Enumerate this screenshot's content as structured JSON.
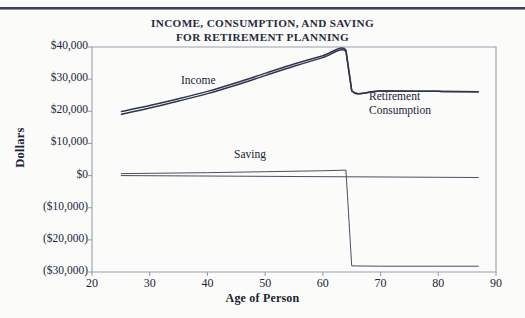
{
  "chart_data": {
    "type": "line",
    "title": "INCOME, CONSUMPTION, AND SAVING FOR RETIREMENT PLANNING",
    "title_line1": "INCOME, CONSUMPTION, AND SAVING",
    "title_line2": "FOR RETIREMENT PLANNING",
    "xlabel": "Age of Person",
    "ylabel": "Dollars",
    "xlim": [
      20,
      90
    ],
    "ylim": [
      -30000,
      40000
    ],
    "grid": false,
    "legend": "inline-annotations",
    "xticks": [
      20,
      30,
      40,
      50,
      60,
      70,
      80,
      90
    ],
    "xtick_labels": [
      "20",
      "30",
      "40",
      "50",
      "60",
      "70",
      "80",
      "90"
    ],
    "yticks": [
      40000,
      30000,
      20000,
      10000,
      0,
      -10000,
      -20000,
      -30000
    ],
    "ytick_labels": [
      "$40,000",
      "$30,000",
      "$20,000",
      "$10,000",
      "$0",
      "($10,000)",
      "($20,000)",
      "($30,000)"
    ],
    "annotations": [
      {
        "text": "Income",
        "x": 43,
        "y": 27500
      },
      {
        "text": "Retirement",
        "x": 72,
        "y": 22500
      },
      {
        "text": "Consumption",
        "x": 72,
        "y": 19500
      },
      {
        "text": "Saving",
        "x": 51,
        "y": 4500
      }
    ],
    "series": [
      {
        "name": "Income",
        "color": "#30354f",
        "x": [
          25,
          30,
          35,
          40,
          45,
          50,
          55,
          60,
          64,
          65,
          70,
          80,
          87
        ],
        "values": [
          19900,
          21800,
          23900,
          26200,
          28900,
          31800,
          34700,
          37300,
          39100,
          26400,
          26300,
          26200,
          26100
        ]
      },
      {
        "name": "Consumption",
        "color": "#30354f",
        "x": [
          25,
          30,
          35,
          40,
          45,
          50,
          55,
          60,
          64,
          65,
          70,
          80,
          87
        ],
        "values": [
          19000,
          21000,
          23200,
          25500,
          28200,
          31100,
          34000,
          36700,
          38600,
          26400,
          26300,
          26200,
          26100
        ]
      },
      {
        "name": "Saving",
        "color": "#4a4f63",
        "x": [
          25,
          30,
          40,
          50,
          60,
          64,
          65,
          70,
          80,
          87
        ],
        "values": [
          600,
          700,
          900,
          1200,
          1500,
          1700,
          -28100,
          -28200,
          -28200,
          -28200
        ]
      },
      {
        "name": "Zero Line",
        "color": "#4a4f63",
        "x": [
          25,
          87
        ],
        "values": [
          0,
          -600
        ]
      }
    ]
  },
  "axis_titles": {
    "y": "Dollars",
    "x": "Age of Person"
  },
  "colors": {
    "line_dark": "#30354f",
    "line_gray": "#4a4f63",
    "frame": "#9aa0ad",
    "text": "#20243a",
    "page_background": "#fbfbf9",
    "top_rule": "#3b3f58"
  }
}
